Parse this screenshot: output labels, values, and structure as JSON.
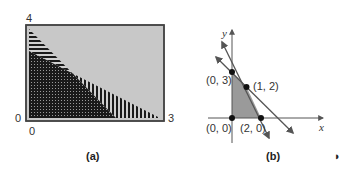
{
  "panel_a": {
    "caption": "(a)",
    "labels": {
      "y_max": "4",
      "y_min": "0",
      "x_min": "0",
      "x_max": "3"
    },
    "colors": {
      "background": "#c8c8c8",
      "frame": "#444444",
      "hatch": "#1a1a1a"
    },
    "regions": [
      {
        "name": "crosshatch-region",
        "vertices": [
          [
            0,
            0
          ],
          [
            0,
            3
          ],
          [
            1,
            2
          ],
          [
            2,
            0
          ]
        ]
      },
      {
        "name": "horizontal-hatch-region",
        "vertices": [
          [
            0,
            3
          ],
          [
            0,
            4
          ],
          [
            1,
            2
          ]
        ]
      },
      {
        "name": "vertical-hatch-region",
        "vertices": [
          [
            1,
            2
          ],
          [
            3,
            0
          ],
          [
            2,
            0
          ]
        ]
      }
    ]
  },
  "panel_b": {
    "caption": "(b)",
    "axes": {
      "x_label": "x",
      "y_label": "y"
    },
    "points": [
      {
        "label": "(0, 3)",
        "x": 0,
        "y": 3
      },
      {
        "label": "(1, 2)",
        "x": 1,
        "y": 2
      },
      {
        "label": "(0, 0)",
        "x": 0,
        "y": 0
      },
      {
        "label": "(2, 0)",
        "x": 2,
        "y": 0
      }
    ],
    "lines": [
      {
        "name": "x + y = 3",
        "through": [
          [
            0,
            3
          ],
          [
            3,
            0
          ]
        ]
      },
      {
        "name": "2x + y = 4",
        "through": [
          [
            0,
            4
          ],
          [
            2,
            0
          ]
        ]
      }
    ],
    "feasible_region": {
      "vertices": [
        [
          0,
          0
        ],
        [
          0,
          3
        ],
        [
          1,
          2
        ],
        [
          2,
          0
        ]
      ],
      "color": "#9a9a9a"
    }
  },
  "page_marker": "◗"
}
